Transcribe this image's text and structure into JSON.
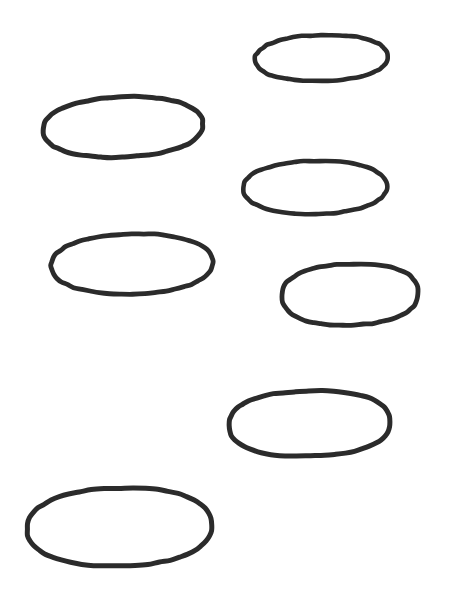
{
  "canvas": {
    "width": 450,
    "height": 597,
    "background_color": "#ffffff",
    "description": "Hand-drawn black ellipse outlines scattered on a plain white background"
  },
  "style": {
    "stroke_color": "#2b2b2b",
    "fill": "none",
    "shape_count": 7
  },
  "shapes": [
    {
      "id": "ellipse-1",
      "name": "ellipse-top-right",
      "cx": 321.5,
      "cy": 58.0,
      "rx": 66.5,
      "ry": 23.0,
      "rotation": -1.5,
      "stroke_width": 4.6,
      "roundness": 0.92
    },
    {
      "id": "ellipse-2",
      "name": "ellipse-upper-left",
      "cx": 123.0,
      "cy": 127.0,
      "rx": 80.0,
      "ry": 30.0,
      "rotation": -2.5,
      "stroke_width": 5.0,
      "roundness": 0.9
    },
    {
      "id": "ellipse-3",
      "name": "ellipse-middle-right",
      "cx": 315.0,
      "cy": 187.5,
      "rx": 72.0,
      "ry": 26.5,
      "rotation": -1.0,
      "stroke_width": 4.6,
      "roundness": 0.93
    },
    {
      "id": "ellipse-4",
      "name": "ellipse-middle-left",
      "cx": 132.0,
      "cy": 264.0,
      "rx": 81.0,
      "ry": 30.0,
      "rotation": -1.5,
      "stroke_width": 4.8,
      "roundness": 0.93
    },
    {
      "id": "ellipse-5",
      "name": "ellipse-lower-right-upper",
      "cx": 350.0,
      "cy": 294.5,
      "rx": 68.0,
      "ry": 30.5,
      "rotation": -2.0,
      "stroke_width": 4.8,
      "roundness": 0.86
    },
    {
      "id": "ellipse-6",
      "name": "ellipse-lower-right",
      "cx": 309.5,
      "cy": 423.5,
      "rx": 80.5,
      "ry": 32.5,
      "rotation": -1.5,
      "stroke_width": 5.0,
      "roundness": 0.85
    },
    {
      "id": "ellipse-7",
      "name": "ellipse-bottom-left",
      "cx": 119.5,
      "cy": 527.0,
      "rx": 92.5,
      "ry": 39.0,
      "rotation": -1.5,
      "stroke_width": 5.0,
      "roundness": 0.9
    }
  ]
}
